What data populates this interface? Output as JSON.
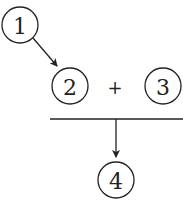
{
  "diagram": {
    "nodes": [
      {
        "id": "1",
        "label": "1"
      },
      {
        "id": "2",
        "label": "2"
      },
      {
        "id": "3",
        "label": "3"
      },
      {
        "id": "4",
        "label": "4"
      }
    ],
    "operator": "+",
    "edges": [
      {
        "from": "1",
        "to": "2"
      },
      {
        "from": "2+3",
        "to": "4"
      }
    ],
    "stroke_color": "#222222"
  }
}
